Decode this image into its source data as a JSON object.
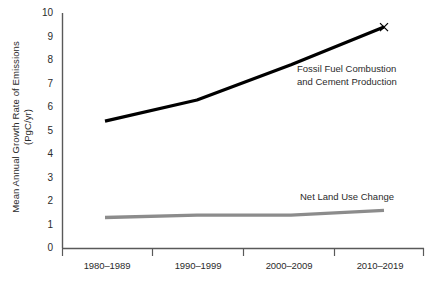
{
  "chart_data": {
    "type": "line",
    "title": "",
    "xlabel": "",
    "ylabel_line1": "Mean Annual Growth Rate of Emissions",
    "ylabel_line2": "(PgC/yr)",
    "categories": [
      "1980–1989",
      "1990–1999",
      "2000–2009",
      "2010–2019"
    ],
    "ylim": [
      0,
      10
    ],
    "yticks": [
      "0",
      "1",
      "2",
      "3",
      "4",
      "5",
      "6",
      "7",
      "8",
      "9",
      "10"
    ],
    "grid": false,
    "legend_position": "inline-annotations",
    "series": [
      {
        "name": "Fossil Fuel Combustion and Cement Production",
        "label_line1": "Fossil Fuel Combustion",
        "label_line2": "and Cement Production",
        "color": "#000000",
        "values": [
          5.4,
          6.3,
          7.8,
          9.4
        ]
      },
      {
        "name": "Net Land Use Change",
        "label_line1": "Net Land Use Change",
        "label_line2": "",
        "color": "#8c8c8c",
        "values": [
          1.3,
          1.4,
          1.4,
          1.6
        ]
      }
    ]
  },
  "axis": {
    "line_color": "#595959",
    "tick_color": "#595959"
  }
}
